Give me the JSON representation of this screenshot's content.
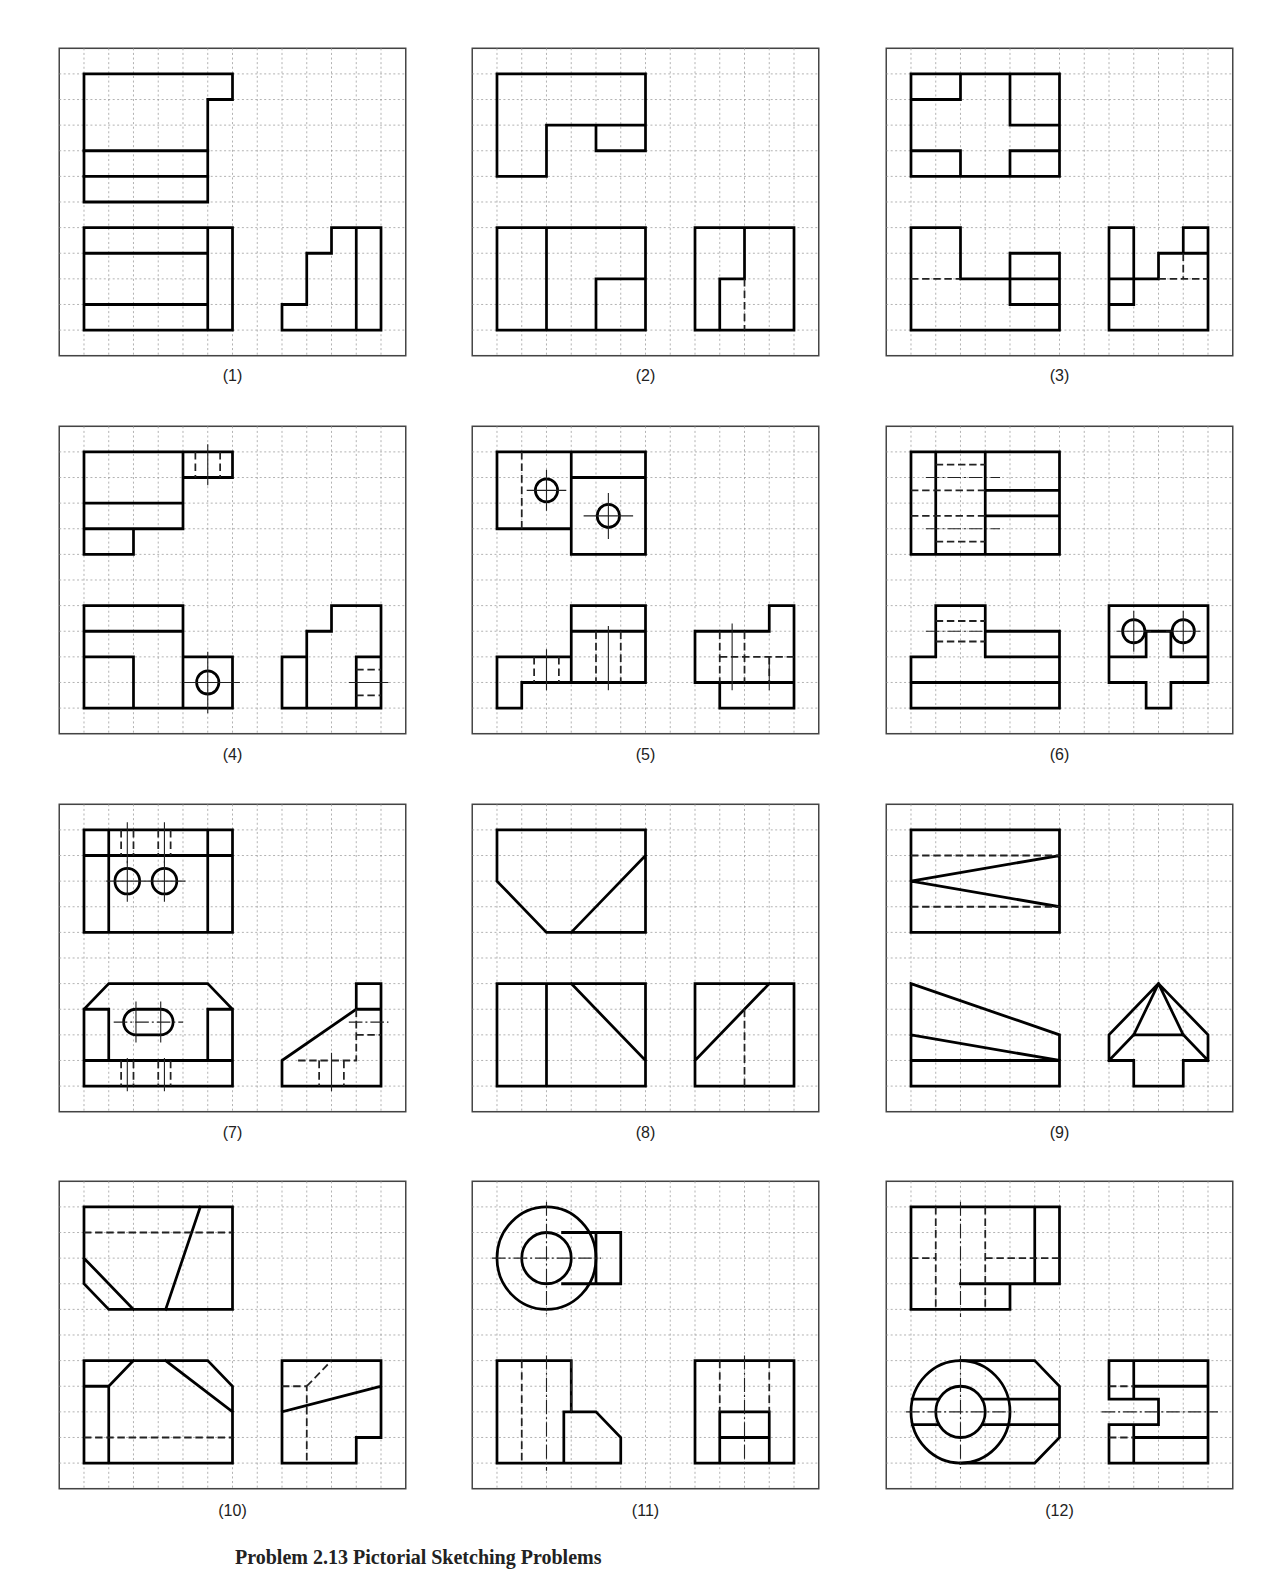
{
  "page": {
    "caption": "Problem 2.13  Pictorial Sketching Problems"
  },
  "grid": {
    "columns": 14,
    "rows": 12
  },
  "colors": {
    "outline": "#000000",
    "grid": "#9a9a9a",
    "frame": "#444444",
    "background": "#ffffff"
  },
  "panels": [
    {
      "id": 1,
      "label": "(1)",
      "views": [
        "top",
        "front",
        "right-side"
      ]
    },
    {
      "id": 2,
      "label": "(2)",
      "views": [
        "top",
        "front",
        "right-side"
      ]
    },
    {
      "id": 3,
      "label": "(3)",
      "views": [
        "top",
        "front",
        "right-side"
      ]
    },
    {
      "id": 4,
      "label": "(4)",
      "views": [
        "top",
        "front",
        "right-side"
      ]
    },
    {
      "id": 5,
      "label": "(5)",
      "views": [
        "top",
        "front",
        "right-side"
      ]
    },
    {
      "id": 6,
      "label": "(6)",
      "views": [
        "top",
        "front",
        "right-side"
      ]
    },
    {
      "id": 7,
      "label": "(7)",
      "views": [
        "top",
        "front",
        "right-side"
      ]
    },
    {
      "id": 8,
      "label": "(8)",
      "views": [
        "top",
        "front",
        "right-side"
      ]
    },
    {
      "id": 9,
      "label": "(9)",
      "views": [
        "top",
        "front",
        "right-side"
      ]
    },
    {
      "id": 10,
      "label": "(10)",
      "views": [
        "top",
        "front",
        "right-side"
      ]
    },
    {
      "id": 11,
      "label": "(11)",
      "views": [
        "top",
        "front",
        "right-side"
      ]
    },
    {
      "id": 12,
      "label": "(12)",
      "views": [
        "top",
        "front",
        "right-side"
      ]
    }
  ]
}
